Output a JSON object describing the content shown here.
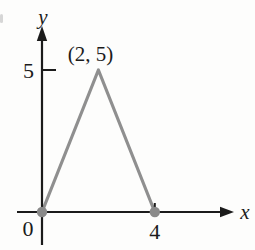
{
  "figure": {
    "background": "#fdfdfc",
    "axis_color": "#1b1b1b",
    "line_color": "#8f8f8f",
    "point_color": "#8a8a8a",
    "xlabel": "x",
    "ylabel": "y",
    "origin_label": "0"
  },
  "chart_data": {
    "type": "line",
    "title": "",
    "xlabel": "x",
    "ylabel": "y",
    "xlim": [
      0,
      6.8
    ],
    "ylim": [
      0,
      6.5
    ],
    "grid": false,
    "series": [
      {
        "name": "triangle-path",
        "points": [
          [
            0,
            0
          ],
          [
            2,
            5
          ],
          [
            4,
            0
          ]
        ],
        "color": "#8f8f8f"
      }
    ],
    "markers": {
      "points": [
        [
          0,
          0
        ],
        [
          4,
          0
        ]
      ],
      "color": "#8a8a8a"
    },
    "x_ticks": [
      {
        "value": 4,
        "label": "4"
      }
    ],
    "y_ticks": [
      {
        "value": 5,
        "label": "5"
      }
    ],
    "origin": {
      "value": 0,
      "label": "0"
    },
    "annotations": [
      {
        "text": "(2, 5)",
        "at": [
          2,
          5
        ]
      }
    ]
  }
}
